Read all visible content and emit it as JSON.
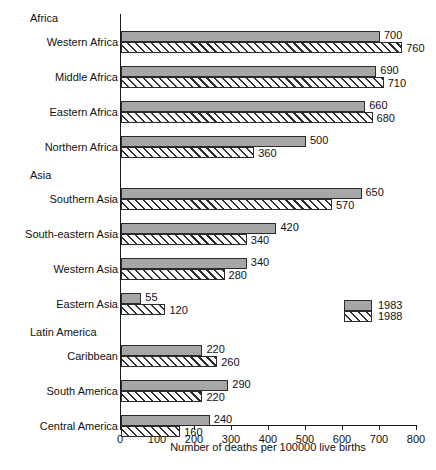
{
  "chart_data": {
    "type": "bar",
    "orientation": "horizontal",
    "title": "",
    "xlabel": "Number of deaths per 100000 live births",
    "ylabel": "",
    "xlim": [
      0,
      800
    ],
    "xticks": [
      0,
      100,
      200,
      300,
      400,
      500,
      600,
      700,
      800
    ],
    "grid": false,
    "legend_position": "right-middle",
    "legend": [
      {
        "name": "1983",
        "style": "solid-gray",
        "color": "#a6a6a6"
      },
      {
        "name": "1988",
        "style": "diagonal-hatch",
        "color": "#ffffff"
      }
    ],
    "groups": [
      {
        "name": "Africa",
        "categories": [
          "Western Africa",
          "Middle Africa",
          "Eastern Africa",
          "Northern Africa"
        ]
      },
      {
        "name": "Asia",
        "categories": [
          "Southern Asia",
          "South-eastern Asia",
          "Western Asia",
          "Eastern Asia"
        ]
      },
      {
        "name": "Latin America",
        "categories": [
          "Caribbean",
          "South America",
          "Central America"
        ]
      }
    ],
    "categories": [
      "Western Africa",
      "Middle Africa",
      "Eastern Africa",
      "Northern Africa",
      "Southern Asia",
      "South-eastern Asia",
      "Western Asia",
      "Eastern Asia",
      "Caribbean",
      "South America",
      "Central America"
    ],
    "series": [
      {
        "name": "1983",
        "values": [
          700,
          690,
          660,
          500,
          650,
          420,
          340,
          55,
          220,
          290,
          240
        ]
      },
      {
        "name": "1988",
        "values": [
          760,
          710,
          680,
          360,
          570,
          340,
          280,
          120,
          260,
          220,
          160
        ]
      }
    ]
  },
  "axis": {
    "tick_labels": [
      "0",
      "100",
      "200",
      "300",
      "400",
      "500",
      "600",
      "700",
      "800"
    ],
    "xlabel": "Number of deaths per 100000 live births"
  },
  "groups": [
    {
      "label": "Africa"
    },
    {
      "label": "Asia"
    },
    {
      "label": "Latin America"
    }
  ],
  "rows": [
    {
      "label": "Western Africa",
      "v1983": "700",
      "v1988": "760"
    },
    {
      "label": "Middle Africa",
      "v1983": "690",
      "v1988": "710"
    },
    {
      "label": "Eastern Africa",
      "v1983": "660",
      "v1988": "680"
    },
    {
      "label": "Northern Africa",
      "v1983": "500",
      "v1988": "360"
    },
    {
      "label": "Southern Asia",
      "v1983": "650",
      "v1988": "570"
    },
    {
      "label": "South-eastern Asia",
      "v1983": "420",
      "v1988": "340"
    },
    {
      "label": "Western Asia",
      "v1983": "340",
      "v1988": "280"
    },
    {
      "label": "Eastern Asia",
      "v1983": "55",
      "v1988": "120"
    },
    {
      "label": "Caribbean",
      "v1983": "220",
      "v1988": "260"
    },
    {
      "label": "South America",
      "v1983": "290",
      "v1988": "220"
    },
    {
      "label": "Central America",
      "v1983": "240",
      "v1988": "160"
    }
  ],
  "legend": {
    "items": [
      {
        "label": "1983"
      },
      {
        "label": "1988"
      }
    ]
  }
}
